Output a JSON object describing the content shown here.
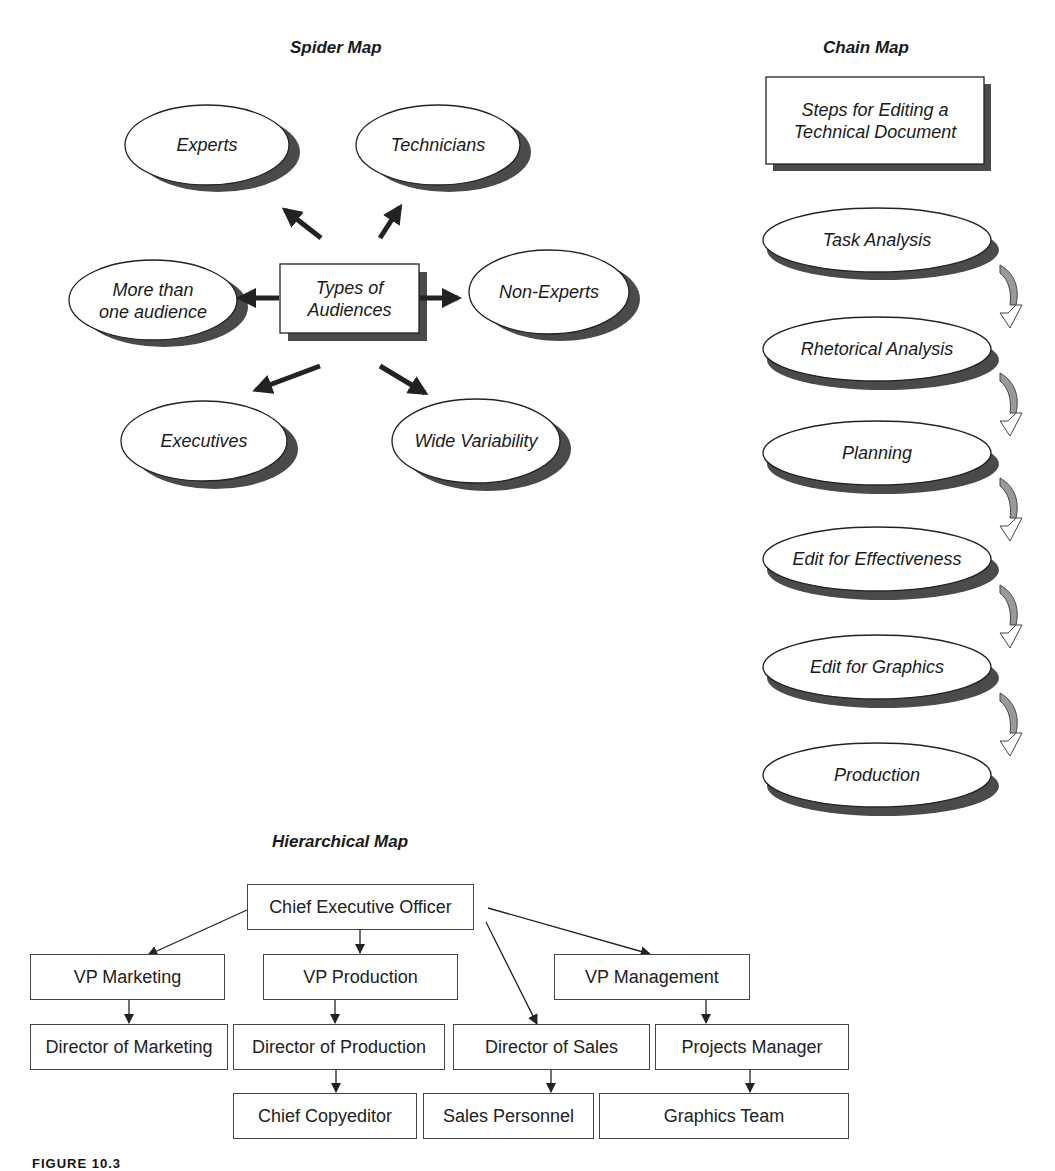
{
  "spider_map": {
    "title": "Spider Map",
    "center": "Types of\nAudiences",
    "center_lines": [
      "Types of",
      "Audiences"
    ],
    "nodes": [
      {
        "label": "Experts",
        "lines": [
          "Experts"
        ],
        "position": "upper-left"
      },
      {
        "label": "Technicians",
        "lines": [
          "Technicians"
        ],
        "position": "upper-right"
      },
      {
        "label": "More than one audience",
        "lines": [
          "More than",
          "one audience"
        ],
        "position": "left"
      },
      {
        "label": "Non-Experts",
        "lines": [
          "Non-Experts"
        ],
        "position": "right"
      },
      {
        "label": "Executives",
        "lines": [
          "Executives"
        ],
        "position": "lower-left"
      },
      {
        "label": "Wide Variability",
        "lines": [
          "Wide Variability"
        ],
        "position": "lower-right"
      }
    ]
  },
  "chain_map": {
    "title": "Chain Map",
    "header": "Steps for Editing a Technical Document",
    "header_lines": [
      "Steps for Editing a",
      "Technical Document"
    ],
    "steps": [
      "Task Analysis",
      "Rhetorical Analysis",
      "Planning",
      "Edit for Effectiveness",
      "Edit for Graphics",
      "Production"
    ]
  },
  "hierarchical_map": {
    "title": "Hierarchical Map",
    "root": "Chief Executive Officer",
    "level1": [
      "VP Marketing",
      "VP Production",
      "VP Management"
    ],
    "level2": [
      "Director of Marketing",
      "Director of Production",
      "Director of Sales",
      "Projects Manager"
    ],
    "level3": [
      "Chief Copyeditor",
      "Sales Personnel",
      "Graphics Team"
    ],
    "edges": [
      [
        "Chief Executive Officer",
        "VP Marketing"
      ],
      [
        "Chief Executive Officer",
        "VP Production"
      ],
      [
        "Chief Executive Officer",
        "Director of Sales"
      ],
      [
        "Chief Executive Officer",
        "VP Management"
      ],
      [
        "VP Marketing",
        "Director of Marketing"
      ],
      [
        "VP Production",
        "Director of Production"
      ],
      [
        "Director of Production",
        "Chief Copyeditor"
      ],
      [
        "VP Management",
        "Projects Manager"
      ],
      [
        "Director of Sales",
        "Sales Personnel"
      ],
      [
        "Projects Manager",
        "Graphics Team"
      ]
    ]
  },
  "figure_label": "FIGURE 10.3",
  "colors": {
    "shadow": "#4a4a4a",
    "stroke": "#222222",
    "curve_fill": "#9a9a9a"
  }
}
